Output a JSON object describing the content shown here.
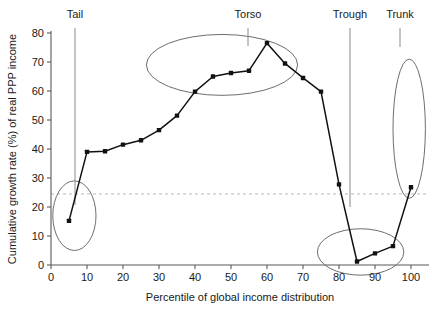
{
  "figure": {
    "width": 432,
    "height": 310,
    "background": "#ffffff"
  },
  "colors": {
    "line": "#111111",
    "point": "#111111",
    "axis": "#595959",
    "annotation": "#6e6e6e",
    "leader": "#8a8a8a",
    "reference_line": "#b9b9b9",
    "text": "#1a1a1a"
  },
  "chart_data": {
    "type": "line",
    "title": "",
    "xlabel": "Percentile of global income distribution",
    "ylabel": "Cumulative growth rate (%) of real PPP income",
    "xlim": [
      0,
      100
    ],
    "ylim": [
      0,
      80
    ],
    "xticks": [
      0,
      10,
      20,
      30,
      40,
      50,
      60,
      70,
      80,
      90,
      100
    ],
    "yticks": [
      0,
      10,
      20,
      30,
      40,
      50,
      60,
      70,
      80
    ],
    "xtick_labels": [
      "0",
      "10",
      "20",
      "30",
      "40",
      "50",
      "60",
      "70",
      "80",
      "90",
      "100"
    ],
    "ytick_labels": [
      "0",
      "10",
      "20",
      "30",
      "40",
      "50",
      "60",
      "70",
      "80"
    ],
    "grid": false,
    "legend": false,
    "x": [
      5,
      10,
      15,
      20,
      25,
      30,
      35,
      40,
      45,
      50,
      55,
      60,
      65,
      70,
      75,
      80,
      85,
      90,
      95,
      100
    ],
    "y": [
      15.2,
      39.0,
      39.2,
      41.5,
      43.0,
      46.5,
      51.5,
      59.8,
      65.0,
      66.2,
      67.0,
      76.5,
      69.5,
      64.5,
      59.8,
      27.8,
      1.2,
      4.0,
      6.5,
      26.8
    ],
    "series": [
      {
        "name": "Cumulative real income growth 1988-2008",
        "values": [
          15.2,
          39.0,
          39.2,
          41.5,
          43.0,
          46.5,
          51.5,
          59.8,
          65.0,
          66.2,
          67.0,
          76.5,
          69.5,
          64.5,
          59.8,
          27.8,
          1.2,
          4.0,
          6.5,
          26.8
        ]
      }
    ],
    "reference_line": {
      "orientation": "horizontal",
      "value": 24.5,
      "style": "dashed"
    },
    "annotations": [
      {
        "label": "Tail",
        "label_x": 9,
        "label_y_px": 18,
        "leader_from_px": [
          75,
          28
        ],
        "leader_to_px": [
          75,
          205
        ],
        "ellipse": {
          "cx_val": 6.5,
          "cy_val": 17.0,
          "rx_val": 6.0,
          "ry_val": 12.0
        }
      },
      {
        "label": "Torso",
        "label_x": 55,
        "label_y_px": 18,
        "leader_from_px": [
          248,
          28
        ],
        "leader_to_px": [
          248,
          46
        ],
        "ellipse": {
          "cx_val": 47.5,
          "cy_val": 69.0,
          "rx_val": 21.0,
          "ry_val": 10.5
        }
      },
      {
        "label": "Trough",
        "label_x": 83,
        "label_y_px": 18,
        "leader_from_px": [
          350,
          28
        ],
        "leader_to_px": [
          350,
          207
        ],
        "ellipse": {
          "cx_val": 86.0,
          "cy_val": 4.5,
          "rx_val": 12.0,
          "ry_val": 8.0
        }
      },
      {
        "label": "Trunk",
        "label_x": 98,
        "label_y_px": 18,
        "leader_from_px": [
          400,
          28
        ],
        "leader_to_px": [
          400,
          47
        ],
        "ellipse": {
          "cx_val": 99.5,
          "cy_val": 47.0,
          "rx_val": 4.5,
          "ry_val": 24.0
        }
      }
    ]
  }
}
